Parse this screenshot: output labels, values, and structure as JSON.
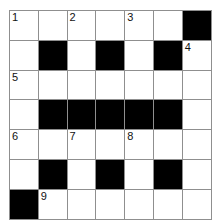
{
  "puzzle": {
    "type": "crossword-grid",
    "rows": 7,
    "columns": 7,
    "cell_size_px": 28,
    "colors": {
      "block": "#000000",
      "open": "#ffffff",
      "gridline": "#8f8f8f",
      "number_text": "#111111",
      "page_background": "#ffffff"
    },
    "numbered_clues": [
      {
        "number": "1",
        "row": 1,
        "col": 1
      },
      {
        "number": "2",
        "row": 1,
        "col": 3
      },
      {
        "number": "3",
        "row": 1,
        "col": 5
      },
      {
        "number": "4",
        "row": 2,
        "col": 7
      },
      {
        "number": "5",
        "row": 3,
        "col": 1
      },
      {
        "number": "6",
        "row": 5,
        "col": 1
      },
      {
        "number": "7",
        "row": 5,
        "col": 3
      },
      {
        "number": "8",
        "row": 5,
        "col": 5
      },
      {
        "number": "9",
        "row": 7,
        "col": 2
      }
    ],
    "grid": [
      [
        {
          "block": false,
          "number": "1"
        },
        {
          "block": false,
          "number": ""
        },
        {
          "block": false,
          "number": "2"
        },
        {
          "block": false,
          "number": ""
        },
        {
          "block": false,
          "number": "3"
        },
        {
          "block": false,
          "number": ""
        },
        {
          "block": true,
          "number": ""
        }
      ],
      [
        {
          "block": false,
          "number": ""
        },
        {
          "block": true,
          "number": ""
        },
        {
          "block": false,
          "number": ""
        },
        {
          "block": true,
          "number": ""
        },
        {
          "block": false,
          "number": ""
        },
        {
          "block": true,
          "number": ""
        },
        {
          "block": false,
          "number": "4"
        }
      ],
      [
        {
          "block": false,
          "number": "5"
        },
        {
          "block": false,
          "number": ""
        },
        {
          "block": false,
          "number": ""
        },
        {
          "block": false,
          "number": ""
        },
        {
          "block": false,
          "number": ""
        },
        {
          "block": false,
          "number": ""
        },
        {
          "block": false,
          "number": ""
        }
      ],
      [
        {
          "block": false,
          "number": ""
        },
        {
          "block": true,
          "number": ""
        },
        {
          "block": true,
          "number": ""
        },
        {
          "block": true,
          "number": ""
        },
        {
          "block": true,
          "number": ""
        },
        {
          "block": true,
          "number": ""
        },
        {
          "block": false,
          "number": ""
        }
      ],
      [
        {
          "block": false,
          "number": "6"
        },
        {
          "block": false,
          "number": ""
        },
        {
          "block": false,
          "number": "7"
        },
        {
          "block": false,
          "number": ""
        },
        {
          "block": false,
          "number": "8"
        },
        {
          "block": false,
          "number": ""
        },
        {
          "block": false,
          "number": ""
        }
      ],
      [
        {
          "block": false,
          "number": ""
        },
        {
          "block": true,
          "number": ""
        },
        {
          "block": false,
          "number": ""
        },
        {
          "block": true,
          "number": ""
        },
        {
          "block": false,
          "number": ""
        },
        {
          "block": true,
          "number": ""
        },
        {
          "block": false,
          "number": ""
        }
      ],
      [
        {
          "block": true,
          "number": ""
        },
        {
          "block": false,
          "number": "9"
        },
        {
          "block": false,
          "number": ""
        },
        {
          "block": false,
          "number": ""
        },
        {
          "block": false,
          "number": ""
        },
        {
          "block": false,
          "number": ""
        },
        {
          "block": false,
          "number": ""
        }
      ]
    ]
  }
}
